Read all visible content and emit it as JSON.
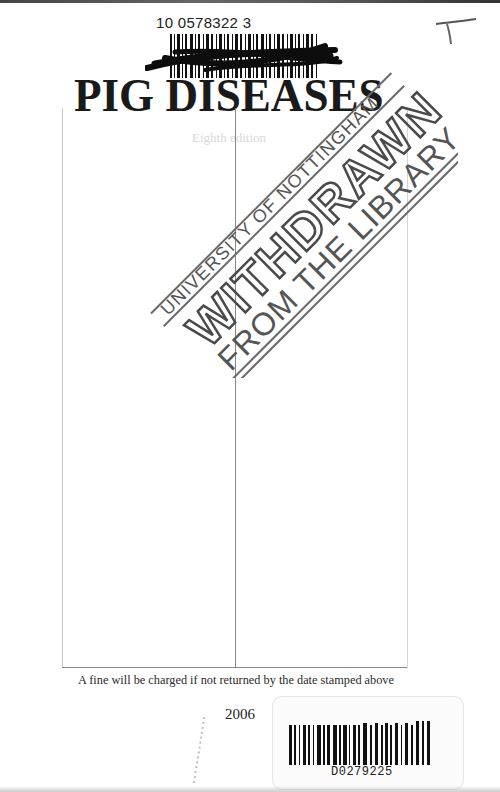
{
  "document": {
    "type": "library book title page scan",
    "accession_number": "10 0578322 3",
    "title": "PIG DISEASES",
    "edition_ghost_text": "Eighth edition",
    "handwritten_mark": "T",
    "stamp": {
      "line1": "UNIVERSITY OF NOTTINGHAM",
      "line2": "WITHDRAWN",
      "line3": "FROM THE LIBRARY"
    },
    "date_due_grid": {
      "columns": 2,
      "stamped_dates": []
    },
    "fine_notice": "A fine will be charged if not returned by the date stamped above",
    "year": "2006",
    "barcode_label": {
      "code": "D0279225"
    }
  }
}
